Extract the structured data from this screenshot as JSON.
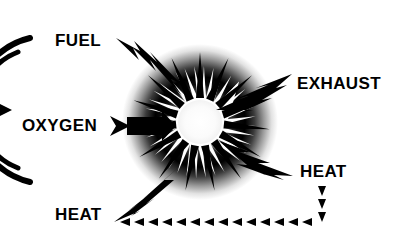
{
  "diagram": {
    "background_color": "#ffffff",
    "ink_color": "#000000",
    "burst": {
      "name": "combustion-burst",
      "center_x": 200,
      "center_y": 122,
      "glow_radius": 78,
      "core_radius": 22,
      "spike_count": 18,
      "spike_outer_radius": 56,
      "glow_stops": [
        "#ffffff",
        "#f2f2f2",
        "#1a1a1a",
        "#000000",
        "#ffffff"
      ]
    },
    "labels": [
      {
        "id": "fuel",
        "text": "FUEL",
        "x": 55,
        "y": 46,
        "anchor": "start",
        "role": "input"
      },
      {
        "id": "oxygen",
        "text": "OXYGEN",
        "x": 22,
        "y": 131,
        "anchor": "start",
        "role": "input"
      },
      {
        "id": "heat-in",
        "text": "HEAT",
        "x": 55,
        "y": 220,
        "anchor": "start",
        "role": "input"
      },
      {
        "id": "exhaust",
        "text": "EXHAUST",
        "x": 297,
        "y": 89,
        "anchor": "start",
        "role": "output"
      },
      {
        "id": "heat-out",
        "text": "HEAT",
        "x": 300,
        "y": 177,
        "anchor": "start",
        "role": "output"
      }
    ],
    "arrows": [
      {
        "id": "fuel-arrow",
        "name": "fuel-arrow",
        "style": "lightning-bolt",
        "from": [
          120,
          41
        ],
        "to": [
          176,
          97
        ],
        "direction": "inward"
      },
      {
        "id": "oxygen-arrow",
        "name": "oxygen-arrow",
        "style": "double-chevron",
        "from": [
          113,
          126
        ],
        "to": [
          160,
          126
        ],
        "direction": "inward"
      },
      {
        "id": "heat-in-arrow",
        "name": "heat-input-arrow",
        "style": "lightning-bolt",
        "from": [
          118,
          218
        ],
        "to": [
          172,
          155
        ],
        "direction": "inward"
      },
      {
        "id": "exhaust-arrow",
        "name": "exhaust-arrow",
        "style": "lightning-bolt",
        "from": [
          222,
          107
        ],
        "to": [
          290,
          80
        ],
        "direction": "outward"
      },
      {
        "id": "heat-out-arrow",
        "name": "heat-output-arrow",
        "style": "lightning-bolt",
        "from": [
          225,
          145
        ],
        "to": [
          291,
          178
        ],
        "direction": "outward"
      }
    ],
    "dashed_loop": {
      "name": "heat-recirculation-loop",
      "style": "triangle-dashes",
      "vertical": {
        "x": 322,
        "y_start": 188,
        "y_end": 222,
        "marks": 3,
        "direction": "down"
      },
      "horizontal": {
        "y": 222,
        "x_start": 322,
        "x_end": 125,
        "marks": 14,
        "direction": "left"
      }
    },
    "left_arc": {
      "name": "engine-cylinder-arc",
      "center_x": -36,
      "center_y": 110,
      "outer_radius": 74,
      "inner_radius": 62,
      "stroke_width": 6,
      "marker": {
        "name": "arc-arrowhead-icon",
        "x": 8,
        "y": 110
      }
    }
  }
}
